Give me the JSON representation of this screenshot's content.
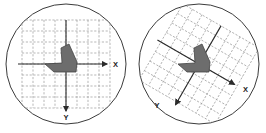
{
  "figure": {
    "title": "",
    "panel_count": 2,
    "background_color": "#ffffff"
  },
  "colors": {
    "circle_stroke": "#3b3b3b",
    "grid_line": "#9a9a9a",
    "axis_line": "#2b2b2b",
    "shape_fill": "#6d6d6d",
    "shape_fill_dark": "#5a5a5a",
    "shape_stroke": "#454545",
    "label_text": "#1c1c1c"
  },
  "panels": [
    {
      "id": "left",
      "name": "unrotated-coordinate-system",
      "circle": {
        "cx": 66,
        "cy": 64,
        "r": 60
      },
      "grid": {
        "cells_x": 8,
        "cells_y": 8,
        "cell_size": 11,
        "rotation_deg": 0,
        "origin_x": 66,
        "origin_y": 64,
        "style": "dashed"
      },
      "axes": {
        "rotation_deg": 0,
        "x_axis": {
          "label": "X",
          "direction": "right",
          "label_x": 113,
          "label_y": 66.5,
          "arrow_tip_x": 108,
          "arrow_tip_y": 64
        },
        "y_axis": {
          "label": "Y",
          "direction": "down",
          "label_x": 66,
          "label_y": 120,
          "arrow_tip_x": 66,
          "arrow_tip_y": 112
        }
      },
      "shape": {
        "name": "dart-polygon",
        "points": "69,44 77,62 76,72 54,72 45,64 62,63 61,48"
      }
    },
    {
      "id": "right",
      "name": "rotated-coordinate-system",
      "circle": {
        "cx": 66,
        "cy": 64,
        "r": 60
      },
      "grid": {
        "cells_x": 8,
        "cells_y": 8,
        "cell_size": 11,
        "rotation_deg": 30,
        "origin_x": 66,
        "origin_y": 64,
        "style": "dashed"
      },
      "axes": {
        "rotation_deg": 30,
        "x_axis": {
          "label": "X",
          "direction": "down-right",
          "label_x": 110,
          "label_y": 92,
          "arrow_tip_x": 104,
          "arrow_tip_y": 86
        },
        "y_axis": {
          "label": "Y",
          "direction": "down-left",
          "label_x": 24,
          "label_y": 108,
          "arrow_tip_x": 26,
          "arrow_tip_y": 99
        }
      },
      "shape": {
        "name": "dart-polygon",
        "points": "69,44 77,62 76,72 54,72 45,64 62,63 61,48"
      }
    }
  ]
}
